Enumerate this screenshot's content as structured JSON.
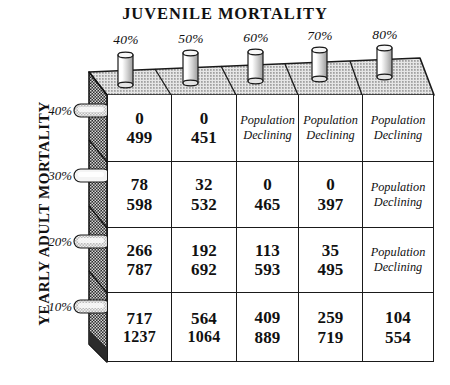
{
  "chart_title": "JUVENILE MORTALITY",
  "y_axis_title": "YEARLY ADULT MORTALITY",
  "colors": {
    "ink": "#1a1a1a",
    "paper": "#ffffff",
    "top_surface": "#d8d8d8",
    "side_panel": "#4a4a4a"
  },
  "columns": [
    {
      "label": "40%"
    },
    {
      "label": "50%"
    },
    {
      "label": "60%"
    },
    {
      "label": "70%"
    },
    {
      "label": "80%"
    }
  ],
  "rows": [
    {
      "label": "40%"
    },
    {
      "label": "30%"
    },
    {
      "label": "20%"
    },
    {
      "label": "10%"
    }
  ],
  "declining_text_line1": "Population",
  "declining_text_line2": "Declining",
  "chart_data": {
    "type": "table",
    "title": "JUVENILE MORTALITY",
    "xlabel": "JUVENILE MORTALITY",
    "ylabel": "YEARLY ADULT MORTALITY",
    "categories": [
      "40%",
      "50%",
      "60%",
      "70%",
      "80%"
    ],
    "row_categories": [
      "40%",
      "30%",
      "20%",
      "10%"
    ],
    "cell_note": "Each populated cell shows two stacked numbers; blank cells read 'Population Declining'.",
    "cells": [
      [
        {
          "top": "0",
          "bottom": "499",
          "declining": false
        },
        {
          "top": "0",
          "bottom": "451",
          "declining": false
        },
        {
          "top": null,
          "bottom": null,
          "declining": true
        },
        {
          "top": null,
          "bottom": null,
          "declining": true
        },
        {
          "top": null,
          "bottom": null,
          "declining": true
        }
      ],
      [
        {
          "top": "78",
          "bottom": "598",
          "declining": false
        },
        {
          "top": "32",
          "bottom": "532",
          "declining": false
        },
        {
          "top": "0",
          "bottom": "465",
          "declining": false
        },
        {
          "top": "0",
          "bottom": "397",
          "declining": false
        },
        {
          "top": null,
          "bottom": null,
          "declining": true
        }
      ],
      [
        {
          "top": "266",
          "bottom": "787",
          "declining": false
        },
        {
          "top": "192",
          "bottom": "692",
          "declining": false
        },
        {
          "top": "113",
          "bottom": "593",
          "declining": false
        },
        {
          "top": "35",
          "bottom": "495",
          "declining": false
        },
        {
          "top": null,
          "bottom": null,
          "declining": true
        }
      ],
      [
        {
          "top": "717",
          "bottom": "1237",
          "declining": false
        },
        {
          "top": "564",
          "bottom": "1064",
          "declining": false
        },
        {
          "top": "409",
          "bottom": "889",
          "declining": false
        },
        {
          "top": "259",
          "bottom": "719",
          "declining": false
        },
        {
          "top": "104",
          "bottom": "554",
          "declining": false
        }
      ]
    ],
    "series": [
      {
        "name": "top_value_row_40%",
        "values": [
          0,
          0,
          null,
          null,
          null
        ]
      },
      {
        "name": "bottom_value_row_40%",
        "values": [
          499,
          451,
          null,
          null,
          null
        ]
      },
      {
        "name": "top_value_row_30%",
        "values": [
          78,
          32,
          0,
          0,
          null
        ]
      },
      {
        "name": "bottom_value_row_30%",
        "values": [
          598,
          532,
          465,
          397,
          null
        ]
      },
      {
        "name": "top_value_row_20%",
        "values": [
          266,
          192,
          113,
          35,
          null
        ]
      },
      {
        "name": "bottom_value_row_20%",
        "values": [
          787,
          692,
          593,
          495,
          null
        ]
      },
      {
        "name": "top_value_row_10%",
        "values": [
          717,
          564,
          409,
          259,
          104
        ]
      },
      {
        "name": "bottom_value_row_10%",
        "values": [
          1237,
          1064,
          889,
          719,
          554
        ]
      }
    ],
    "grid": true,
    "legend": "none"
  }
}
